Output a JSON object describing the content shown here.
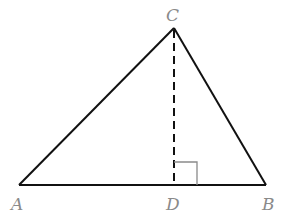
{
  "diagram": {
    "type": "triangle-with-altitude",
    "colors": {
      "edge": "#111111",
      "altitude": "#111111",
      "right_angle_marker": "#8a8a8a",
      "label": "#8a8a8a"
    },
    "points": {
      "A": {
        "label": "A",
        "x": 19,
        "y": 185
      },
      "B": {
        "label": "B",
        "x": 266,
        "y": 185
      },
      "C": {
        "label": "C",
        "x": 174,
        "y": 28
      },
      "D": {
        "label": "D",
        "x": 174,
        "y": 185
      }
    },
    "segments": [
      {
        "from": "A",
        "to": "B",
        "style": "solid"
      },
      {
        "from": "A",
        "to": "C",
        "style": "solid"
      },
      {
        "from": "B",
        "to": "C",
        "style": "solid"
      },
      {
        "from": "C",
        "to": "D",
        "style": "dashed"
      }
    ],
    "right_angle": {
      "at": "D",
      "between": [
        "C",
        "B"
      ]
    }
  }
}
